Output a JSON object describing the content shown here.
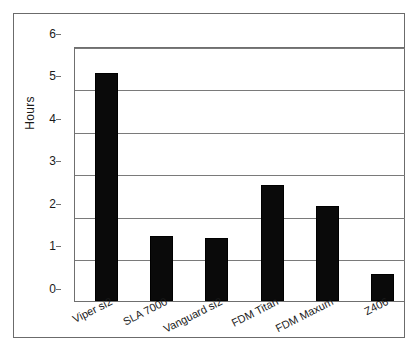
{
  "chart_data": {
    "type": "bar",
    "title": "",
    "subtitle": "",
    "xlabel": "",
    "ylabel": "Hours",
    "categories": [
      "Viper si2",
      "SLA 7000",
      "Vanguard si2",
      "FDM Titan",
      "FDM Maxum",
      "Z406"
    ],
    "values": [
      5.4,
      1.55,
      1.5,
      2.75,
      2.25,
      0.65
    ],
    "ylim": [
      0,
      6
    ],
    "yticks": [
      "0",
      "1",
      "2",
      "3",
      "4",
      "5",
      "6"
    ],
    "ytick_values": [
      0,
      1,
      2,
      3,
      4,
      5,
      6
    ],
    "grid": "horizontal",
    "legend": "none",
    "bar_color": "#000000",
    "axis_color": "#6f6f6f",
    "background": "#ffffff"
  }
}
